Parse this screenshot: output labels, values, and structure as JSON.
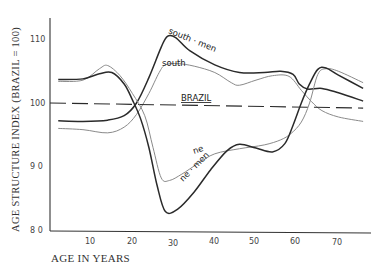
{
  "chart_data": {
    "type": "line",
    "title": "",
    "xlabel": "AGE IN YEARS",
    "ylabel": "AGE STRUCTURE INDEX (BRAZIL = 100)",
    "xlim": [
      0,
      78
    ],
    "ylim": [
      80,
      113
    ],
    "x_ticks": [
      10,
      20,
      30,
      40,
      50,
      60,
      70
    ],
    "y_ticks": [
      80,
      90,
      100,
      110
    ],
    "grid": false,
    "legend": "inline labels on curves",
    "series": [
      {
        "name": "south-men",
        "style": "solid-dark",
        "points": [
          [
            2,
            97.2
          ],
          [
            8,
            97.1
          ],
          [
            14,
            97.3
          ],
          [
            18,
            98.0
          ],
          [
            21,
            100.0
          ],
          [
            24,
            104.0
          ],
          [
            27,
            108.8
          ],
          [
            28.5,
            110.5
          ],
          [
            30.5,
            110.3
          ],
          [
            34,
            108.2
          ],
          [
            40,
            106.0
          ],
          [
            46,
            104.8
          ],
          [
            52,
            104.8
          ],
          [
            56,
            105.0
          ],
          [
            59,
            104.5
          ],
          [
            60.5,
            103.0
          ],
          [
            62.5,
            102.2
          ],
          [
            66,
            102.3
          ],
          [
            70,
            101.6
          ],
          [
            76,
            100.3
          ]
        ]
      },
      {
        "name": "south",
        "style": "solid-light",
        "points": [
          [
            2,
            96.0
          ],
          [
            8,
            95.8
          ],
          [
            14,
            95.3
          ],
          [
            18,
            96.2
          ],
          [
            21,
            98.2
          ],
          [
            24,
            101.5
          ],
          [
            26.5,
            104.8
          ],
          [
            28,
            106.0
          ],
          [
            31,
            106.2
          ],
          [
            35,
            105.8
          ],
          [
            40,
            104.8
          ],
          [
            44,
            103.2
          ],
          [
            46,
            102.8
          ],
          [
            50,
            103.6
          ],
          [
            54,
            104.3
          ],
          [
            58,
            104.2
          ],
          [
            61,
            102.0
          ],
          [
            63.5,
            100.2
          ],
          [
            66,
            98.8
          ],
          [
            70,
            97.8
          ],
          [
            76,
            97.1
          ]
        ]
      },
      {
        "name": "BRAZIL",
        "style": "dashed",
        "points": [
          [
            0,
            100.0
          ],
          [
            76,
            99.2
          ]
        ]
      },
      {
        "name": "ne",
        "style": "solid-light",
        "points": [
          [
            2,
            103.4
          ],
          [
            8,
            103.6
          ],
          [
            12,
            105.4
          ],
          [
            14,
            105.9
          ],
          [
            17,
            104.3
          ],
          [
            20,
            101.5
          ],
          [
            23,
            98.0
          ],
          [
            25,
            93.0
          ],
          [
            27,
            88.2
          ],
          [
            29,
            87.8
          ],
          [
            32,
            88.8
          ],
          [
            36,
            90.5
          ],
          [
            40,
            92.0
          ],
          [
            46,
            92.8
          ],
          [
            52,
            93.4
          ],
          [
            56,
            94.2
          ],
          [
            58.5,
            95.2
          ],
          [
            61,
            97.0
          ],
          [
            63,
            100.0
          ],
          [
            65,
            104.5
          ],
          [
            67,
            105.4
          ],
          [
            70,
            105.0
          ],
          [
            76,
            103.2
          ]
        ]
      },
      {
        "name": "ne-men",
        "style": "solid-dark",
        "points": [
          [
            2,
            103.7
          ],
          [
            8,
            103.8
          ],
          [
            12,
            104.6
          ],
          [
            15,
            104.8
          ],
          [
            18,
            103.0
          ],
          [
            20,
            100.5
          ],
          [
            22,
            97.5
          ],
          [
            24,
            93.0
          ],
          [
            26,
            87.0
          ],
          [
            28,
            82.9
          ],
          [
            31,
            83.3
          ],
          [
            35,
            86.0
          ],
          [
            39,
            89.5
          ],
          [
            43,
            92.5
          ],
          [
            46,
            93.5
          ],
          [
            50,
            92.9
          ],
          [
            54,
            92.3
          ],
          [
            57,
            93.6
          ],
          [
            59,
            96.5
          ],
          [
            61,
            100.0
          ],
          [
            63,
            103.0
          ],
          [
            65,
            105.3
          ],
          [
            67,
            105.5
          ],
          [
            70,
            104.4
          ],
          [
            76,
            102.3
          ]
        ]
      }
    ],
    "annotations": [
      {
        "text": "south · men",
        "near_series": "south-men"
      },
      {
        "text": "south",
        "near_series": "south"
      },
      {
        "text": "BRAZIL",
        "near_series": "BRAZIL"
      },
      {
        "text": "ne",
        "near_series": "ne"
      },
      {
        "text": "ne · men",
        "near_series": "ne-men"
      }
    ]
  },
  "labels": {
    "ylabel": "AGE STRUCTURE INDEX (BRAZIL = 100)",
    "xlabel": "AGE IN YEARS",
    "south_men": "south · men",
    "south": "south",
    "brazil": "BRAZIL",
    "ne": "ne",
    "ne_men": "ne · men"
  },
  "colors": {
    "dark_line": "#2a2a2a",
    "light_line": "#8a8a8a",
    "axis": "#333333"
  }
}
